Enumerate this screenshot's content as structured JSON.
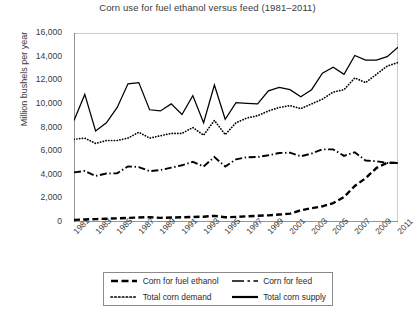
{
  "chart_data": {
    "type": "line",
    "title": "Corn use for fuel ethanol versus feed (1981–2011)",
    "xlabel": "",
    "ylabel": "Million bushels per year",
    "ylim": [
      0,
      16000
    ],
    "ytick_step": 2000,
    "yticks": [
      "0",
      "2,000",
      "4,000",
      "6,000",
      "8,000",
      "10,000",
      "12,000",
      "14,000",
      "16,000"
    ],
    "ytick_values": [
      0,
      2000,
      4000,
      6000,
      8000,
      10000,
      12000,
      14000,
      16000
    ],
    "xlim": [
      1981,
      2011
    ],
    "x": [
      1981,
      1982,
      1983,
      1984,
      1985,
      1986,
      1987,
      1988,
      1989,
      1990,
      1991,
      1992,
      1993,
      1994,
      1995,
      1996,
      1997,
      1998,
      1999,
      2000,
      2001,
      2002,
      2003,
      2004,
      2005,
      2006,
      2007,
      2008,
      2009,
      2010,
      2011
    ],
    "xtick_labels": [
      "1981",
      "1983",
      "1985",
      "1987",
      "1989",
      "1991",
      "1993",
      "1995",
      "1997",
      "1999",
      "2001",
      "2003",
      "2005",
      "2007",
      "2009",
      "2011"
    ],
    "xtick_values": [
      1981,
      1983,
      1985,
      1987,
      1989,
      1991,
      1993,
      1995,
      1997,
      1999,
      2001,
      2003,
      2005,
      2007,
      2009,
      2011
    ],
    "grid": false,
    "legend_position": "below-center",
    "legend_columns": 2,
    "series": [
      {
        "name": "Corn for fuel ethanol",
        "style": "thick-dashed",
        "color": "#000000",
        "values": [
          180,
          215,
          245,
          280,
          310,
          345,
          380,
          415,
          350,
          380,
          400,
          425,
          450,
          520,
          400,
          430,
          480,
          525,
          565,
          630,
          705,
          995,
          1170,
          1325,
          1600,
          2120,
          3050,
          3710,
          4570,
          5020,
          5000
        ]
      },
      {
        "name": "Corn for feed",
        "style": "dash-dot",
        "color": "#000000",
        "values": [
          4200,
          4320,
          3900,
          4100,
          4130,
          4710,
          4650,
          4300,
          4400,
          4600,
          4800,
          5100,
          4700,
          5500,
          4700,
          5300,
          5480,
          5500,
          5650,
          5840,
          5870,
          5560,
          5800,
          6150,
          6150,
          5600,
          5900,
          5200,
          5150,
          5000,
          5000
        ]
      },
      {
        "name": "Total corn demand",
        "style": "dotted",
        "color": "#000000",
        "values": [
          7000,
          7100,
          6650,
          6900,
          6900,
          7100,
          7600,
          7100,
          7300,
          7500,
          7500,
          8000,
          7350,
          8600,
          7400,
          8400,
          8800,
          9000,
          9400,
          9700,
          9850,
          9600,
          10000,
          10400,
          11000,
          11200,
          12200,
          11800,
          12500,
          13200,
          13500
        ]
      },
      {
        "name": "Total corn supply",
        "style": "solid",
        "color": "#000000",
        "values": [
          8600,
          10800,
          7700,
          8400,
          9700,
          11700,
          11800,
          9500,
          9400,
          10000,
          9100,
          10700,
          8400,
          11600,
          8700,
          10100,
          10050,
          10000,
          11100,
          11400,
          11200,
          10600,
          11200,
          12600,
          13100,
          12500,
          14100,
          13700,
          13700,
          14000,
          14800
        ]
      }
    ]
  }
}
